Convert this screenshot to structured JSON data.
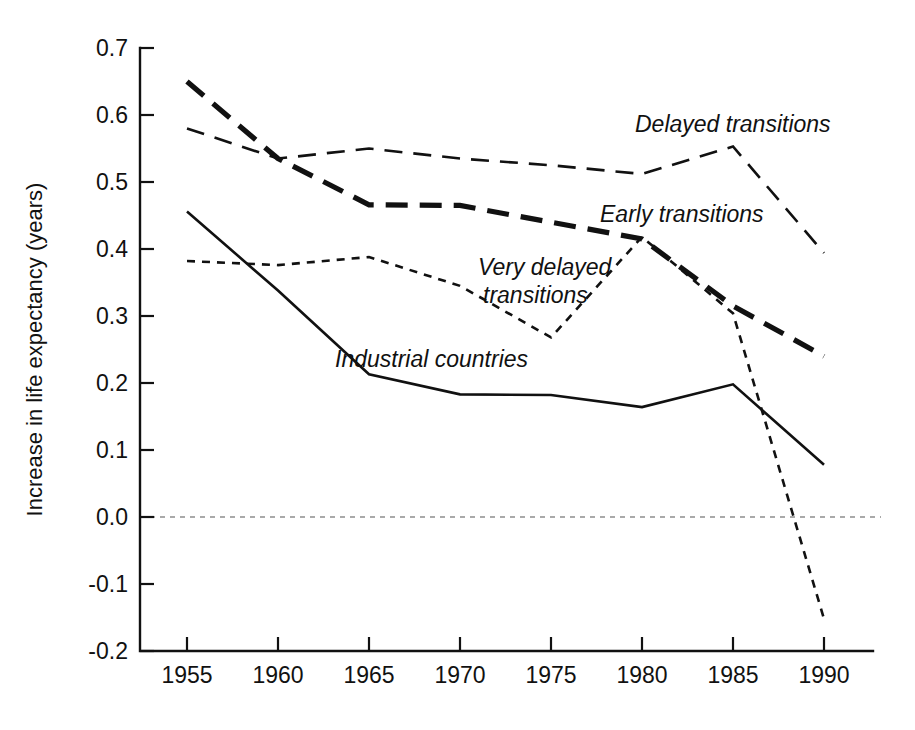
{
  "chart_data": {
    "type": "line",
    "title": "",
    "subtitle": "",
    "xlabel": "",
    "ylabel": "Increase in life expectancy (years)",
    "x": [
      1955,
      1960,
      1965,
      1970,
      1975,
      1980,
      1985,
      1990
    ],
    "xtick_labels": [
      "1955",
      "1960",
      "1965",
      "1970",
      "1975",
      "1980",
      "1985",
      "1990"
    ],
    "ytick_labels": [
      "0.7",
      "0.6",
      "0.5",
      "0.4",
      "0.3",
      "0.2",
      "0.1",
      "0.0",
      "-0.1",
      "-0.2"
    ],
    "yticks": [
      0.7,
      0.6,
      0.5,
      0.4,
      0.3,
      0.2,
      0.1,
      0.0,
      -0.1,
      -0.2
    ],
    "xlim": [
      1952.5,
      1993.0
    ],
    "ylim": [
      -0.2,
      0.7
    ],
    "grid": false,
    "legend_position": "inline-annotations",
    "zero_reference_line": 0.0,
    "series": [
      {
        "name": "Early transitions",
        "style": "thick-dashed",
        "color": "#111111",
        "values": [
          0.65,
          0.535,
          0.466,
          0.465,
          0.44,
          0.415,
          0.315,
          0.24
        ],
        "annotation": "Early transitions"
      },
      {
        "name": "Delayed transitions",
        "style": "thin-dashed",
        "color": "#111111",
        "values": [
          0.58,
          0.535,
          0.55,
          0.535,
          0.525,
          0.512,
          0.553,
          0.394
        ],
        "annotation": "Delayed transitions"
      },
      {
        "name": "Very delayed transitions",
        "style": "fine-dashed",
        "color": "#111111",
        "values": [
          0.382,
          0.376,
          0.388,
          0.345,
          0.268,
          0.418,
          0.304,
          -0.152
        ],
        "annotation": "Very delayed transitions"
      },
      {
        "name": "Industrial countries",
        "style": "solid",
        "color": "#111111",
        "values": [
          0.456,
          0.338,
          0.213,
          0.183,
          0.182,
          0.164,
          0.198,
          0.078
        ],
        "annotation": "Industrial countries"
      }
    ],
    "annotations": [
      {
        "id": "delayed-transitions-label",
        "text": "Delayed transitions",
        "x": 635,
        "y": 132
      },
      {
        "id": "early-transitions-label",
        "text": "Early transitions",
        "x": 600,
        "y": 222
      },
      {
        "id": "very-delayed-transitions-label-line1",
        "text": "Very delayed",
        "x": 478,
        "y": 275
      },
      {
        "id": "very-delayed-transitions-label-line2",
        "text": "transitions",
        "x": 483,
        "y": 303
      },
      {
        "id": "industrial-countries-label",
        "text": "Industrial countries",
        "x": 335,
        "y": 367
      }
    ]
  }
}
